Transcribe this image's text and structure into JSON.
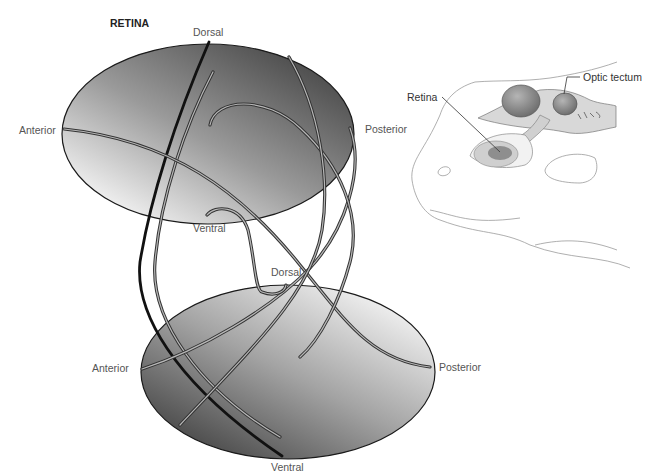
{
  "figure": {
    "title": "RETINA",
    "retina_labels": {
      "dorsal": "Dorsal",
      "ventral": "Ventral",
      "anterior": "Anterior",
      "posterior": "Posterior"
    },
    "tectum_labels": {
      "dorsal": "Dorsal",
      "ventral": "Ventral",
      "anterior": "Anterior",
      "posterior": "Posterior"
    },
    "inset": {
      "retina_label": "Retina",
      "tectum_label": "Optic tectum"
    }
  },
  "colors": {
    "ellipse_dark": "#4a4a4a",
    "ellipse_light": "#e6e6e6",
    "axon_outline": "#333333",
    "axon_fill": "#b8b8b8",
    "solid_axon": "#111111",
    "label_text": "#555555"
  }
}
